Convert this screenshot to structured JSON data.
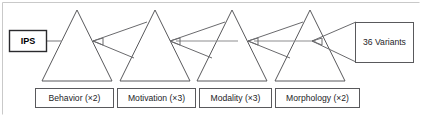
{
  "diagram": {
    "colors": {
      "stroke": "#59595c",
      "link": "#6a6a6d",
      "text": "#1d1d1f",
      "background": "#ffffff",
      "frame": "#c9c9c9"
    },
    "source_node": {
      "label": "IPS",
      "name": "ips-box"
    },
    "result_node": {
      "label": "36 Variants",
      "name": "variants-box"
    },
    "stages": [
      {
        "label": "Behavior (×2)",
        "factor": 2,
        "name": "behavior"
      },
      {
        "label": "Motivation (×3)",
        "factor": 3,
        "name": "motivation"
      },
      {
        "label": "Modality (×3)",
        "factor": 3,
        "name": "modality"
      },
      {
        "label": "Morphology (×2)",
        "factor": 2,
        "name": "morphology"
      }
    ],
    "connectors": [
      {
        "from": "ips",
        "to": "behavior",
        "kind": "line"
      },
      {
        "from": "motivation",
        "to": "behavior",
        "kind": "arrow-fan"
      },
      {
        "from": "modality",
        "to": "motivation",
        "kind": "arrow-fan"
      },
      {
        "from": "morphology",
        "to": "modality",
        "kind": "arrow-fan"
      },
      {
        "from": "variants",
        "to": "morphology",
        "kind": "arrow-fan"
      }
    ]
  }
}
